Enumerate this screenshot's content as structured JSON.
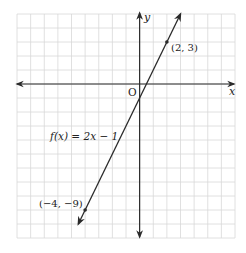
{
  "chart_data": {
    "type": "line",
    "title": "",
    "xlabel": "x",
    "ylabel": "y",
    "origin_label": "O",
    "xlim": [
      -9,
      7
    ],
    "ylim": [
      -11,
      5
    ],
    "grid": true,
    "series": [
      {
        "name": "f(x) = 2x − 1",
        "equation": "f(x) = 2x − 1",
        "slope": 2,
        "intercept": -1,
        "x": [
          -4.5,
          3
        ],
        "y": [
          -10,
          5
        ]
      }
    ],
    "points": [
      {
        "x": 2,
        "y": 3,
        "label": "(2, 3)"
      },
      {
        "x": -4,
        "y": -9,
        "label": "(−4, −9)"
      }
    ],
    "annotations": [
      {
        "text": "f(x) = 2x − 1",
        "near": "line, left of y-axis, around y = -3"
      }
    ]
  },
  "labels": {
    "x_axis": "x",
    "y_axis": "y",
    "origin": "O",
    "function": "f(x) = 2x − 1",
    "point_a": "(2, 3)",
    "point_b": "(−4, −9)"
  }
}
